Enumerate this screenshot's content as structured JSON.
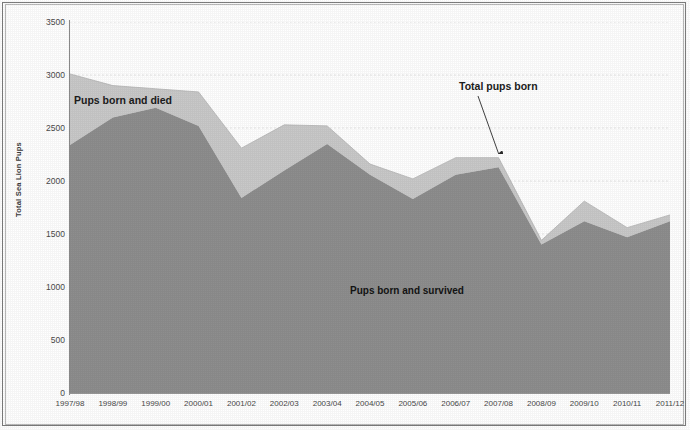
{
  "chart_data": {
    "type": "area",
    "stacked": true,
    "title": "",
    "subtitle": "",
    "xlabel": "",
    "ylabel": "Total Sea Lion Pups",
    "ylim": [
      0,
      3500
    ],
    "ytick_step": 500,
    "yticks": [
      "3500",
      "3000",
      "2500",
      "2000",
      "1500",
      "1000",
      "500",
      "0"
    ],
    "ytick_values": [
      3500,
      3000,
      2500,
      2000,
      1500,
      1000,
      500,
      0
    ],
    "grid": true,
    "grid_axis": "y",
    "legend_position": "none",
    "categories": [
      "1997/98",
      "1998/99",
      "1999/00",
      "2000/01",
      "2001/02",
      "2002/03",
      "2003/04",
      "2004/05",
      "2005/06",
      "2006/07",
      "2007/08",
      "2008/09",
      "2009/10",
      "2010/11",
      "2011/12"
    ],
    "series": [
      {
        "name": "Pups born and survived",
        "color": "#8e8e8e",
        "values": [
          2340,
          2600,
          2690,
          2520,
          1840,
          2100,
          2350,
          2060,
          1830,
          2060,
          2130,
          1400,
          1620,
          1470,
          1620
        ]
      },
      {
        "name": "Pups born and died",
        "color": "#c9c9c9",
        "values": [
          670,
          300,
          180,
          320,
          470,
          430,
          170,
          100,
          190,
          160,
          90,
          40,
          190,
          90,
          60
        ]
      }
    ],
    "totals": {
      "name": "Total pups born",
      "values": [
        3010,
        2900,
        2870,
        2840,
        2310,
        2530,
        2520,
        2160,
        2020,
        2220,
        2220,
        1440,
        1810,
        1560,
        1680
      ]
    },
    "annotations": [
      {
        "id": "annotation-total-pups-born",
        "text": "Total pups born",
        "points_to_category": "2007/08",
        "points_to_value": 2220
      },
      {
        "id": "area-label-born-and-died",
        "text": "Pups born and died"
      },
      {
        "id": "area-label-born-and-survived",
        "text": "Pups born and survived"
      }
    ],
    "colors": {
      "survived": "#8e8e8e",
      "died": "#c9c9c9",
      "axis": "#8a8a8a",
      "grid": "#dcdcdc",
      "text": "#3a3a3a",
      "background": "#ffffff"
    }
  }
}
